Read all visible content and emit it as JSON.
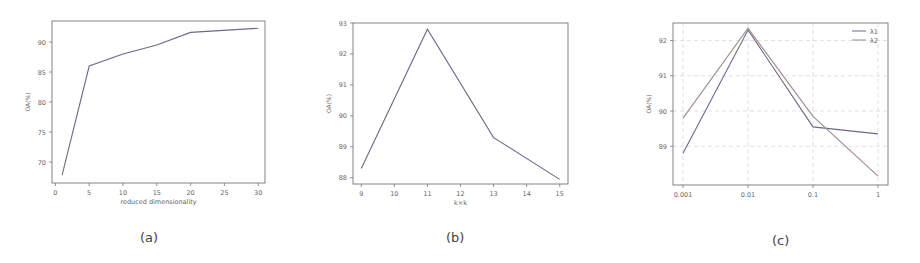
{
  "captions": [
    "(a)",
    "(b)",
    "(c)"
  ],
  "chart_data": [
    {
      "type": "line",
      "panel": "(a)",
      "title": "",
      "xlabel": "reduced dimensionality",
      "ylabel": "OA(%)",
      "xticks": [
        0,
        5,
        10,
        15,
        20,
        25,
        30
      ],
      "yticks": [
        70,
        75,
        80,
        85,
        90
      ],
      "xlim": [
        -0.5,
        31
      ],
      "ylim": [
        66.5,
        93.5
      ],
      "grid": false,
      "series": [
        {
          "name": "OA",
          "x": [
            1,
            5,
            10,
            15,
            20,
            30
          ],
          "values": [
            67.8,
            86.0,
            88.0,
            89.5,
            91.6,
            92.3
          ],
          "color": "#6a6a8a"
        }
      ]
    },
    {
      "type": "line",
      "panel": "(b)",
      "title": "",
      "xlabel": "k×k",
      "ylabel": "OA(%)",
      "xticks": [
        9,
        10,
        11,
        12,
        13,
        14,
        15
      ],
      "yticks": [
        88,
        89,
        90,
        91,
        92,
        93
      ],
      "xlim": [
        8.75,
        15.25
      ],
      "ylim": [
        87.8,
        93.0
      ],
      "grid": false,
      "series": [
        {
          "name": "OA",
          "x": [
            9,
            11,
            13,
            15
          ],
          "values": [
            88.3,
            92.8,
            89.3,
            87.95
          ],
          "color": "#6a6a8a"
        }
      ]
    },
    {
      "type": "line",
      "panel": "(c)",
      "title": "",
      "xlabel": "",
      "ylabel": "OA(%)",
      "xticks": [
        "0.001",
        "0.01",
        "0.1",
        "1"
      ],
      "yticks": [
        89,
        90,
        91,
        92
      ],
      "ylim": [
        87.9,
        92.5
      ],
      "grid": true,
      "legend_position": "upper right",
      "series": [
        {
          "name": "λ1",
          "x": [
            "0.001",
            "0.01",
            "0.1",
            "1"
          ],
          "values": [
            88.8,
            92.3,
            89.55,
            89.35
          ],
          "color": "#6a6a8a"
        },
        {
          "name": "λ2",
          "x": [
            "0.001",
            "0.01",
            "0.1",
            "1"
          ],
          "values": [
            89.8,
            92.35,
            89.85,
            88.15
          ],
          "color": "#a08a8a"
        }
      ]
    }
  ]
}
